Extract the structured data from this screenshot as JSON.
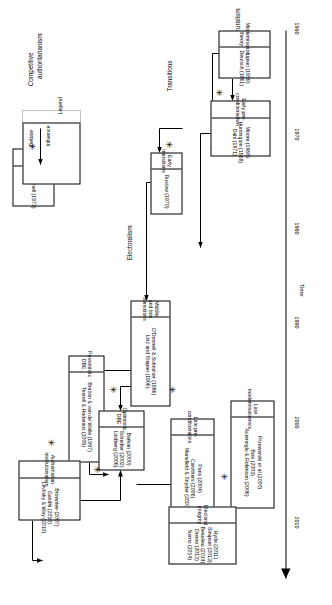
{
  "figure": {
    "axis": {
      "name": "Time",
      "ticks": [
        "1960",
        "1970",
        "1980",
        "1990",
        "2000",
        "2010"
      ]
    },
    "categories": [
      {
        "id": "structuralism",
        "label": "Structuralism"
      },
      {
        "id": "transitions",
        "label": "Transitions"
      },
      {
        "id": "electoralism",
        "label": "Electoralism"
      },
      {
        "id": "competitive-authoritarianism",
        "label": "Competitive\nauthoritarianism"
      }
    ],
    "categories_flat": {
      "structuralism": "Structuralism",
      "transitions": "Transitions",
      "electoralism": "Electoralism",
      "competitive_1": "Competitive",
      "competitive_2": "authoritarianism"
    },
    "boxes": [
      {
        "id": "modernisation-theory",
        "title_line1": "Modernisation",
        "title_line2": "theory",
        "refs": [
          "Lipset  (1959)",
          "Deutsch (1961)"
        ]
      },
      {
        "id": "early-pre-conditionalism",
        "title_line1": "Early pre-",
        "title_line2": "conditionalism",
        "refs": [
          "Moore (1966)",
          "Huntington (1968)",
          "Dahl (1971)"
        ]
      },
      {
        "id": "late-modernisationists",
        "title_line1": "Late modernisationists",
        "title_line2": "",
        "refs": [
          "Przeworski et al (2000)",
          "Boix (2003)",
          "Acemoglu & Robinson (2006)"
        ]
      },
      {
        "id": "early-transitions",
        "title_line1": "Early transitions",
        "title_line2": "",
        "refs": [
          "Rustow (1970)"
        ]
      },
      {
        "id": "middle-and-late-transitions",
        "title_line1": "Middle and late transitions",
        "title_line2": "",
        "refs": [
          "O'Donnell & Schmitter (1986)",
          "Linz and Stepan (1996)"
        ]
      },
      {
        "id": "late-pre-conditionalists",
        "title_line1": "Late pre-conditionalists",
        "title_line2": "",
        "refs": [
          "Paris (2004)",
          "Carothers (2006)",
          "Mansfield & Snyder (2007)"
        ]
      },
      {
        "id": "pessimistic-dbe",
        "title_line1": "Pessimistic DBE",
        "title_line2": "",
        "refs": [
          "Bratton & van de Walle (1997)",
          "Teorell & Hadenius (2009)"
        ]
      },
      {
        "id": "optimistic-dbe",
        "title_line1": "Optimistic DBE",
        "title_line2": "",
        "refs": [
          "Barkan (2000)",
          "Schedler (2002)",
          "Lindberg (2006)"
        ]
      },
      {
        "id": "electoral-integrity",
        "title_line1": "Electoral integrity",
        "title_line2": "",
        "refs": [
          "Hyde (2011)",
          "Simpser (2013)",
          "Beaulieu (2014)",
          "Donno (2013)",
          "Norris (2014)"
        ]
      },
      {
        "id": "bureaucratic-authoritarianism",
        "title_line1": "Bureaucratic",
        "title_line2": "authoritarianism",
        "refs": [
          "O'Donnell (1973)"
        ]
      },
      {
        "id": "authoritarian-institutionalism",
        "title_line1": "Authoritarian",
        "title_line2": "institutionalism",
        "refs": [
          "Brownlee (2007)",
          "Gandhi (2010)",
          "Levitsky & Way (2010)"
        ]
      }
    ],
    "box_text": {
      "modernisation_theory": {
        "t1": "Modernisation",
        "t2": "theory",
        "r0": "Lipset  (1959)",
        "r1": "Deutsch (1961)"
      },
      "early_pre_conditionalism": {
        "t1": "Early pre-",
        "t2": "conditionalism",
        "r0": "Moore (1966)",
        "r1": "Huntington (1968)",
        "r2": "Dahl (1971)"
      },
      "late_modernisationists": {
        "t1": "Late modernisationists",
        "r0": "Przeworski et al (2000)",
        "r1": "Boix (2003)",
        "r2": "Acemoglu & Robinson (2006)"
      },
      "early_transitions": {
        "t1": "Early transitions",
        "r0": "Rustow (1970)"
      },
      "middle_and_late_transitions": {
        "t1": "Middle and late transitions",
        "r0": "O'Donnell & Schmitter (1986)",
        "r1": "Linz and Stepan (1996)"
      },
      "late_pre_conditionalists": {
        "t1": "Late pre-conditionalists",
        "r0": "Paris (2004)",
        "r1": "Carothers (2006)",
        "r2": "Mansfield & Snyder (2007)"
      },
      "pessimistic_dbe": {
        "t1": "Pessimistic DBE",
        "r0": "Bratton & van de Walle (1997)",
        "r1": "Teorell & Hadenius (2009)"
      },
      "optimistic_dbe": {
        "t1": "Optimistic DBE",
        "r0": "Barkan (2000)",
        "r1": "Schedler (2002)",
        "r2": "Lindberg (2006)"
      },
      "electoral_integrity": {
        "t1": "Electoral integrity",
        "r0": "Hyde (2011)",
        "r1": "Simpser (2013)",
        "r2": "Beaulieu (2014)",
        "r3": "Donno (2013)",
        "r4": "Norris (2014)"
      },
      "bureaucratic_authoritarianism": {
        "t1": "Bureaucratic",
        "t2": "authoritarianism",
        "r0": "O'Donnell (1973)"
      },
      "authoritarian_institutionalism": {
        "t1": "Authoritarian",
        "t2": "institutionalism",
        "r0": "Brownlee (2007)",
        "r1": "Gandhi (2010)",
        "r2": "Levitsky & Way (2010)"
      }
    },
    "legend": {
      "title": "Legend",
      "influence": "Influence",
      "debate": "Debate",
      "debate_glyph": "✳"
    },
    "marks": {
      "debate_glyph": "✳"
    },
    "colors": {
      "ink": "#000000",
      "paper": "#ffffff"
    }
  }
}
